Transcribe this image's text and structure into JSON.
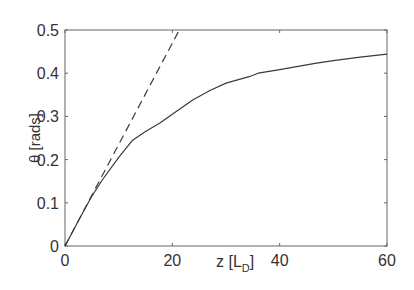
{
  "chart_data": {
    "type": "line",
    "title": "",
    "xlabel": "z [L_D]",
    "xlabel_main": "z [L",
    "xlabel_sub": "D",
    "xlabel_close": "]",
    "ylabel": "θ [rads]",
    "xlim": [
      0,
      60
    ],
    "ylim": [
      0,
      0.5
    ],
    "xticks": [
      0,
      20,
      40,
      60
    ],
    "xtick_labels": [
      "0",
      "20",
      "40",
      "60"
    ],
    "yticks": [
      0,
      0.1,
      0.2,
      0.3,
      0.4,
      0.5
    ],
    "ytick_labels": [
      "0",
      "0.1",
      "0.2",
      "0.3",
      "0.4",
      "0.5"
    ],
    "grid": false,
    "legend": null,
    "series": [
      {
        "name": "solid",
        "style": "solid",
        "x": [
          0,
          3,
          5,
          7,
          10,
          12.6,
          15,
          17.6,
          20,
          23.8,
          27,
          30,
          34.3,
          36,
          40,
          46.6,
          50,
          55,
          60
        ],
        "y": [
          0,
          0.07,
          0.115,
          0.154,
          0.205,
          0.245,
          0.265,
          0.284,
          0.305,
          0.338,
          0.36,
          0.377,
          0.392,
          0.4,
          0.408,
          0.423,
          0.429,
          0.437,
          0.444
        ]
      },
      {
        "name": "dashed",
        "style": "dashed",
        "x": [
          0,
          21.3
        ],
        "y": [
          0,
          0.5
        ]
      }
    ]
  },
  "colors": {
    "line": "#3a3a3a",
    "axis": "#555555",
    "text": "#333333"
  }
}
